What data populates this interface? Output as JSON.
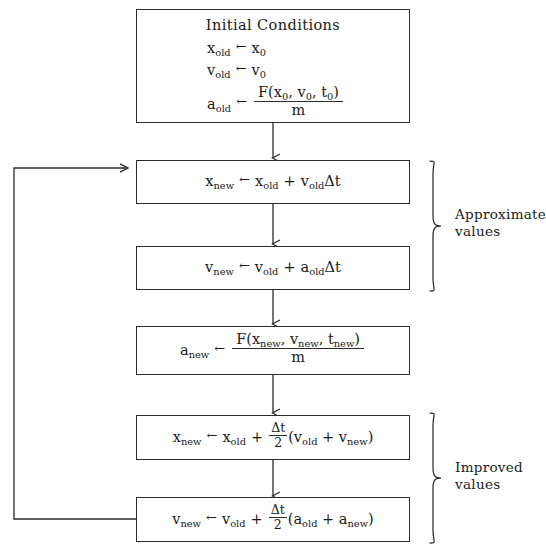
{
  "diagram": {
    "line_color": "#2b2b2b",
    "background": "#ffffff",
    "boxes": [
      {
        "id": "initial-conditions",
        "heading": "Initial Conditions",
        "lines": [
          {
            "lhs": "x",
            "lhs_sub": "old",
            "op": "←",
            "rhs_plain": "x",
            "rhs_sub": "0"
          },
          {
            "lhs": "v",
            "lhs_sub": "old",
            "op": "←",
            "rhs_plain": "v",
            "rhs_sub": "0"
          },
          {
            "lhs": "a",
            "lhs_sub": "old",
            "op": "←",
            "numerator": "F(x0, v0, t0)",
            "denominator": "m"
          }
        ]
      },
      {
        "id": "x-new-approx",
        "text": "x_new ← x_old + v_oldΔt"
      },
      {
        "id": "v-new-approx",
        "text": "v_new ← v_old + a_oldΔt"
      },
      {
        "id": "a-new",
        "text": "a_new ← F(x_new, v_new, t_new) / m"
      },
      {
        "id": "x-new-improved",
        "text": "x_new ← x_old + (Δt/2)(v_old + v_new)"
      },
      {
        "id": "v-new-improved",
        "text": "v_new ← v_old + (Δt/2)(a_old + a_new)"
      }
    ],
    "symbols": {
      "assign": "←",
      "delta_t": "Δt",
      "x": "x",
      "v": "v",
      "a": "a",
      "t": "t",
      "F": "F",
      "m": "m",
      "plus": "+",
      "sub_old": "old",
      "sub_new": "new",
      "sub_zero": "0",
      "two": "2",
      "paren_open": "(",
      "paren_close": ")",
      "comma": ",",
      "heading": "Initial Conditions"
    },
    "side_labels": [
      {
        "id": "approximate-values",
        "line1": "Approximate",
        "line2": "values"
      },
      {
        "id": "improved-values",
        "line1": "Improved",
        "line2": "values"
      }
    ]
  }
}
